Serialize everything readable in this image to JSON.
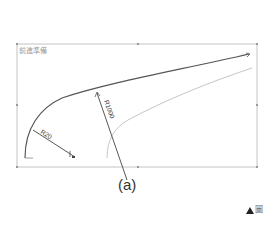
{
  "diagram": {
    "frame_label": "前進準備",
    "dimension_small_radius": "R20",
    "dimension_large_radius": "R1000",
    "caption": "(a)",
    "corner_mark_text": "圖",
    "colors": {
      "frame": "#bfbfbf",
      "main_curve": "#555555",
      "offset_curve": "#c8c8c8",
      "dimension_line": "#444444"
    }
  }
}
